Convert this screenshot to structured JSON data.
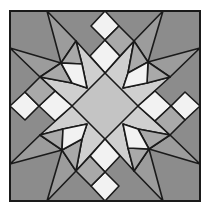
{
  "block": {
    "center": [
      105,
      106
    ],
    "half_size": 95,
    "stroke_color": "#1a1a1a",
    "stroke_width": 1.6
  },
  "colors": {
    "background": "#8c8c8c",
    "light": "#cfcfcf",
    "center": "#c4c4c4",
    "white": "#f2f2f2",
    "medium": "#a9a9a9",
    "ray": "#9c9c9c"
  },
  "quadrant_shapes": [
    {
      "name": "light-star-area",
      "fill": "light",
      "points": [
        [
          0,
          -33
        ],
        [
          29,
          -65
        ],
        [
          23,
          -33
        ],
        [
          18,
          -18
        ],
        [
          42,
          -23
        ],
        [
          65,
          -29
        ],
        [
          33,
          0
        ],
        [
          0,
          0
        ]
      ]
    },
    {
      "name": "long-ray-left",
      "fill": "ray",
      "points": [
        [
          58,
          -95
        ],
        [
          29,
          -65
        ],
        [
          43,
          -44
        ]
      ]
    },
    {
      "name": "long-ray-right",
      "fill": "ray",
      "points": [
        [
          95,
          -58
        ],
        [
          65,
          -29
        ],
        [
          43,
          -44
        ]
      ]
    },
    {
      "name": "medium-triangle-left",
      "fill": "medium",
      "points": [
        [
          29,
          -65
        ],
        [
          43,
          -44
        ],
        [
          23,
          -33
        ]
      ]
    },
    {
      "name": "medium-triangle-right",
      "fill": "medium",
      "points": [
        [
          65,
          -29
        ],
        [
          43,
          -44
        ],
        [
          42,
          -23
        ]
      ]
    },
    {
      "name": "white-kite",
      "fill": "white",
      "points": [
        [
          43,
          -44
        ],
        [
          23,
          -33
        ],
        [
          18,
          -18
        ],
        [
          42,
          -23
        ]
      ]
    },
    {
      "name": "outer-white-diamond",
      "fill": "white",
      "points": [
        [
          0,
          -95
        ],
        [
          14,
          -80
        ],
        [
          0,
          -66
        ],
        [
          -14,
          -80
        ]
      ]
    },
    {
      "name": "inner-white-diamond",
      "fill": "white",
      "points": [
        [
          0,
          -66
        ],
        [
          15,
          -50
        ],
        [
          0,
          -33
        ],
        [
          -15,
          -50
        ]
      ]
    },
    {
      "name": "gray-diamond",
      "fill": "medium",
      "points": [
        [
          14,
          -80
        ],
        [
          29,
          -65
        ],
        [
          15,
          -50
        ],
        [
          0,
          -66
        ]
      ]
    }
  ],
  "center_diamond": {
    "fill": "center",
    "points": [
      [
        0,
        -33
      ],
      [
        33,
        0
      ],
      [
        0,
        33
      ],
      [
        -33,
        0
      ]
    ]
  }
}
